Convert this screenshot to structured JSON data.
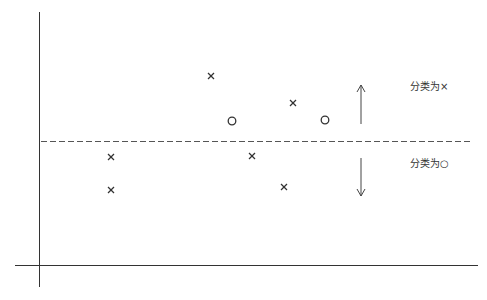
{
  "diagram": {
    "title": "",
    "colors": {
      "stroke": "#333333",
      "dashed": "#555555",
      "background": "#ffffff"
    },
    "axes": {
      "y_axis": {
        "x": 39.5,
        "y1": 12,
        "y2": 287
      },
      "x_axis": {
        "y": 265.5,
        "x1": 15,
        "x2": 478
      }
    },
    "boundary": {
      "style": "dashed",
      "y": 141.5,
      "x1": 41,
      "x2": 470
    },
    "arrows": [
      {
        "direction": "up",
        "x": 361,
        "y_from": 124,
        "y_to": 85
      },
      {
        "direction": "down",
        "x": 361,
        "y_from": 158,
        "y_to": 196
      }
    ],
    "labels": [
      {
        "text": "分类为×",
        "x": 410,
        "y": 81,
        "region": "above"
      },
      {
        "text": "分类为○",
        "x": 410,
        "y": 158,
        "region": "below"
      }
    ],
    "points": [
      {
        "marker": "x",
        "x": 211,
        "y": 76
      },
      {
        "marker": "x",
        "x": 293,
        "y": 103
      },
      {
        "marker": "o",
        "x": 232,
        "y": 121
      },
      {
        "marker": "o",
        "x": 325,
        "y": 120
      },
      {
        "marker": "x",
        "x": 111,
        "y": 157
      },
      {
        "marker": "x",
        "x": 252,
        "y": 156
      },
      {
        "marker": "x",
        "x": 111,
        "y": 190
      },
      {
        "marker": "x",
        "x": 284,
        "y": 187
      }
    ]
  }
}
